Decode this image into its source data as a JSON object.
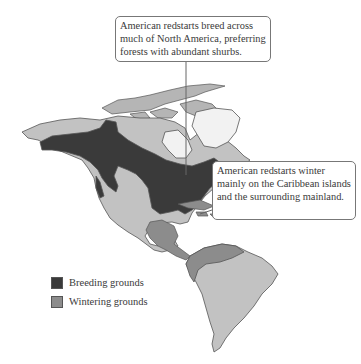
{
  "figure": {
    "colors": {
      "breeding": "#3a3a3a",
      "wintering": "#8c8c8c",
      "land": "#c2c2c2",
      "ice_greenland": "#f2f2f2",
      "border": "#555555"
    }
  },
  "callouts": {
    "breeding": "American redstarts breed across much of North America, preferring forests with abundant shurbs.",
    "wintering": "American redstarts winter mainly on the Caribbean islands and the surrounding mainland."
  },
  "legend": {
    "items": [
      {
        "label": "Breeding grounds",
        "color": "#3a3a3a"
      },
      {
        "label": "Wintering grounds",
        "color": "#8c8c8c"
      }
    ]
  }
}
